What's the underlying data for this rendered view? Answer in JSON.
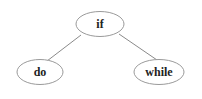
{
  "diagram": {
    "type": "tree",
    "colors": {
      "background": "#ffffff",
      "node_stroke": "#9a9a9a",
      "edge_stroke": "#8a8a8a",
      "text": "#222222"
    },
    "nodes": [
      {
        "id": "if",
        "label": "if",
        "cx": 100,
        "cy": 24,
        "rx": 24,
        "ry": 12.5
      },
      {
        "id": "do",
        "label": "do",
        "cx": 40,
        "cy": 72,
        "rx": 23,
        "ry": 12.5
      },
      {
        "id": "while",
        "label": "while",
        "cx": 159,
        "cy": 72,
        "rx": 25,
        "ry": 12.5
      }
    ],
    "edges": [
      {
        "from": "if",
        "to": "do",
        "x1": 81,
        "y1": 35,
        "x2": 47,
        "y2": 61
      },
      {
        "from": "if",
        "to": "while",
        "x1": 119,
        "y1": 34,
        "x2": 157,
        "y2": 60
      }
    ]
  }
}
